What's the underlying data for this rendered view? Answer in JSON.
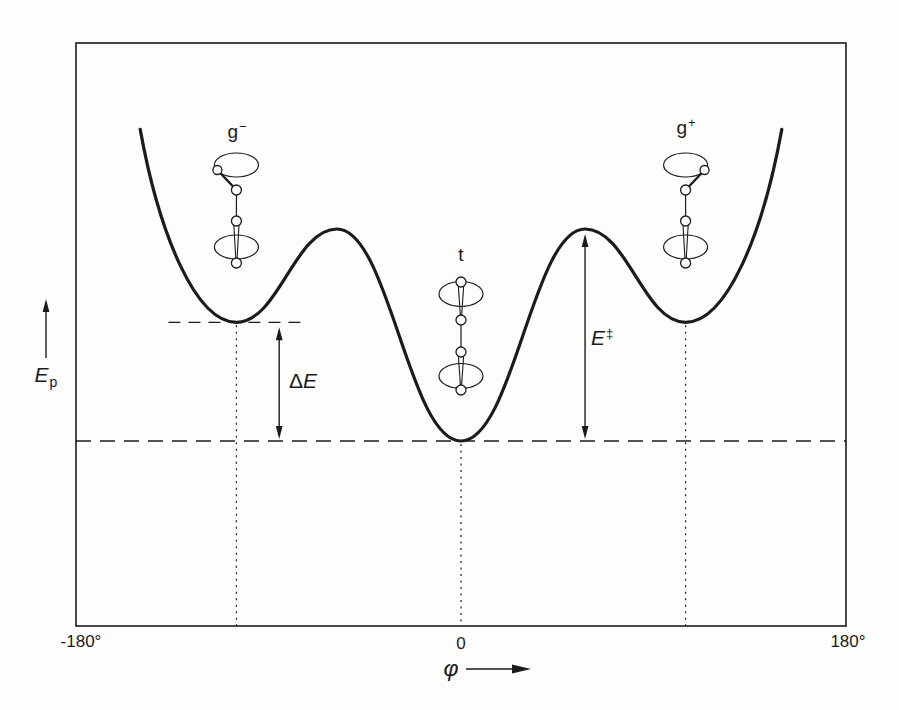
{
  "figure": {
    "bg": "#fdfdfc",
    "ink": "#1b1b1b"
  },
  "axes": {
    "y_label": {
      "base": "E",
      "sub": "p"
    },
    "x_label": {
      "symbol": "φ"
    },
    "x_ticks": [
      {
        "phi": -180,
        "label": "-180°"
      },
      {
        "phi": 0,
        "label": "0"
      },
      {
        "phi": 180,
        "label": "180°"
      }
    ]
  },
  "levels": {
    "trans_E": 0,
    "gauche_E": 0.56
  },
  "annotations": {
    "delta_e": {
      "delta": "Δ",
      "base": "E",
      "phi": -85,
      "from_E": 0.56,
      "to_E": 0
    },
    "barrier": {
      "base": "E",
      "sup": "‡",
      "phi": 58,
      "from_E": 1,
      "to_E": 0
    }
  },
  "conformers": [
    {
      "id": "g-minus",
      "type": "gauche-minus",
      "label": {
        "base": "g",
        "sup": "−"
      },
      "phi": -105
    },
    {
      "id": "trans",
      "type": "trans",
      "label": {
        "base": "t",
        "sup": ""
      },
      "phi": 0
    },
    {
      "id": "g-plus",
      "type": "gauche-plus",
      "label": {
        "base": "g",
        "sup": "+"
      },
      "phi": 105
    }
  ],
  "chart_data": {
    "type": "line",
    "title": "",
    "xlabel": "φ",
    "ylabel": "Ep",
    "x_range": [
      -180,
      180
    ],
    "y_range_E": [
      0,
      1.47
    ],
    "grid": false,
    "curve_extrema": [
      {
        "phi": -150,
        "E": 1.47,
        "kind": "edge"
      },
      {
        "phi": -105,
        "E": 0.56,
        "kind": "min",
        "conformer": "g−"
      },
      {
        "phi": -58,
        "E": 1,
        "kind": "max"
      },
      {
        "phi": 0,
        "E": 0,
        "kind": "min",
        "conformer": "t"
      },
      {
        "phi": 58,
        "E": 1,
        "kind": "max"
      },
      {
        "phi": 105,
        "E": 0.56,
        "kind": "min",
        "conformer": "g+"
      },
      {
        "phi": 150,
        "E": 1.47,
        "kind": "edge"
      }
    ],
    "annotations": [
      "ΔE",
      "E‡"
    ]
  }
}
